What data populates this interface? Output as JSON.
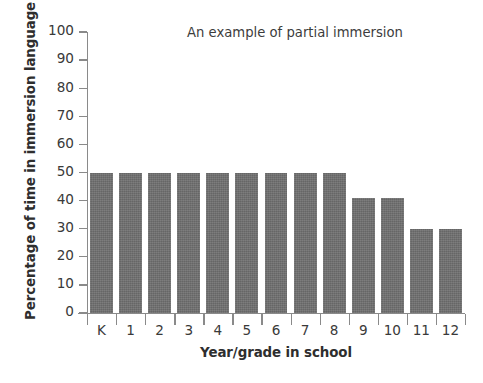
{
  "chart_data": {
    "type": "bar",
    "title": "An example of partial immersion",
    "xlabel": "Year/grade in school",
    "ylabel": "Percentage of time in immersion language",
    "categories": [
      "K",
      "1",
      "2",
      "3",
      "4",
      "5",
      "6",
      "7",
      "8",
      "9",
      "10",
      "11",
      "12"
    ],
    "values": [
      50,
      50,
      50,
      50,
      50,
      50,
      50,
      50,
      50,
      41,
      41,
      30,
      30
    ],
    "ylim": [
      0,
      100
    ],
    "yticks": [
      0,
      10,
      20,
      30,
      40,
      50,
      60,
      70,
      80,
      90,
      100
    ],
    "ytick_labels": [
      "0",
      "10",
      "20",
      "30",
      "40",
      "50",
      "60",
      "70",
      "80",
      "90",
      "100"
    ],
    "grid": false,
    "legend": "none",
    "bar_color": "#6f6f6f",
    "axis_color": "#8a8a8a",
    "background_color": "#ffffff"
  }
}
